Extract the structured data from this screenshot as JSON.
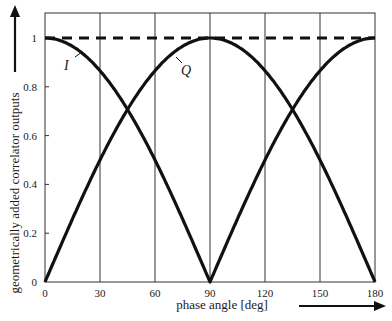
{
  "chart_data": {
    "type": "line",
    "title": "",
    "xlabel": "phase angle [deg]",
    "ylabel": "geometrically added correlator outputs",
    "xlim": [
      0,
      180
    ],
    "ylim": [
      0,
      1.1
    ],
    "xticks": [
      0,
      30,
      60,
      90,
      120,
      150,
      180
    ],
    "xtick_labels": [
      "0",
      "30",
      "60",
      "90",
      "120",
      "150",
      "180"
    ],
    "yticks": [
      0,
      0.2,
      0.4,
      0.6,
      0.8,
      1
    ],
    "ytick_labels": [
      "0",
      "0.2",
      "0.4",
      "0.6",
      "0.8",
      "1"
    ],
    "grid": {
      "vertical": true,
      "horizontal": false
    },
    "x": [
      0,
      15,
      30,
      45,
      60,
      75,
      90,
      105,
      120,
      135,
      150,
      165,
      180
    ],
    "series": [
      {
        "name": "I",
        "style": "solid",
        "values": [
          1.0,
          0.966,
          0.866,
          0.707,
          0.5,
          0.259,
          0.0,
          0.259,
          0.5,
          0.707,
          0.866,
          0.966,
          1.0
        ]
      },
      {
        "name": "Q",
        "style": "solid",
        "values": [
          0.0,
          0.259,
          0.5,
          0.707,
          0.866,
          0.966,
          1.0,
          0.966,
          0.866,
          0.707,
          0.5,
          0.259,
          0.0
        ]
      },
      {
        "name": "sum",
        "style": "dashed",
        "values": [
          1,
          1,
          1,
          1,
          1,
          1,
          1,
          1,
          1,
          1,
          1,
          1,
          1
        ]
      }
    ],
    "annotations": [
      {
        "text": "I",
        "near_x": 12,
        "near_y": 0.88
      },
      {
        "text": "Q",
        "near_x": 70,
        "near_y": 0.88
      }
    ]
  }
}
